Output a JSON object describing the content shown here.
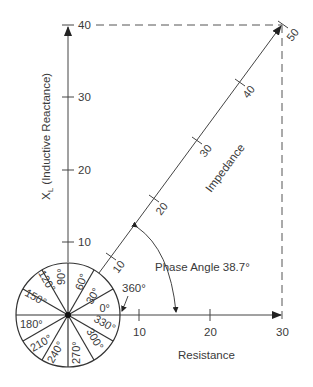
{
  "diagram": {
    "y_axis": {
      "label": "X",
      "label_sub": "L",
      "label_rest": " (Inductive Reactance)",
      "ticks": [
        "10",
        "20",
        "30",
        "40"
      ]
    },
    "x_axis": {
      "label": "Resistance",
      "ticks": [
        "10",
        "20",
        "30"
      ]
    },
    "vector": {
      "label": "Impedance",
      "ticks": [
        "10",
        "20",
        "30",
        "40",
        "50"
      ]
    },
    "phase_angle": {
      "label": "Phase Angle 38.7°"
    },
    "full_circle_label": "360°",
    "degree_wheel": [
      "0°",
      "30°",
      "60°",
      "90°",
      "120°",
      "150°",
      "180°",
      "210°",
      "240°",
      "270°",
      "300°",
      "330°"
    ]
  },
  "colors": {
    "line": "#444444",
    "text": "#3a3a3a",
    "background": "#ffffff"
  }
}
